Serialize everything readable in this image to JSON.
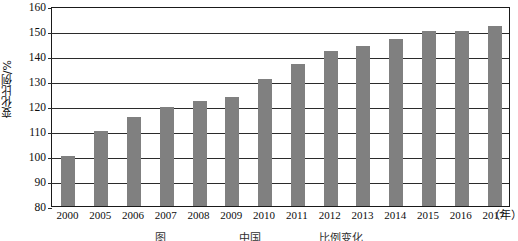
{
  "chart_data": {
    "type": "bar",
    "title": "",
    "xlabel": "年",
    "ylabel": "变化比例/%",
    "categories": [
      "2000",
      "2005",
      "2006",
      "2007",
      "2008",
      "2009",
      "2010",
      "2011",
      "2012",
      "2013",
      "2014",
      "2015",
      "2016",
      "2017"
    ],
    "values": [
      100,
      110,
      115.5,
      119.5,
      122,
      123.5,
      131,
      137,
      142,
      144,
      147,
      150,
      150,
      152
    ],
    "ylim": [
      80,
      160
    ],
    "yticks": [
      80,
      90,
      100,
      110,
      120,
      130,
      140,
      150,
      160
    ],
    "ytick_labels": [
      "80",
      "90",
      "100",
      "110",
      "120",
      "130",
      "140",
      "150",
      "160"
    ],
    "grid": true,
    "legend": "none",
    "bar_color": "#808080",
    "axis_color": "#1a1a1a"
  },
  "axes": {
    "y_axis_title": "变化比例/%",
    "x_axis_unit": "（年）"
  },
  "caption": {
    "text": "图    　　　　　  　中国 　 　 　  　比例变化"
  }
}
